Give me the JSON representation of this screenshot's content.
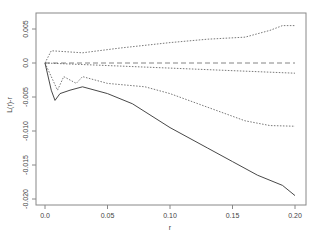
{
  "chart_data": {
    "type": "line",
    "title": "",
    "xlabel": "r",
    "ylabel": "L(r)-r",
    "xlim": [
      0.0,
      0.2
    ],
    "ylim": [
      -0.02,
      0.006
    ],
    "xticks": [
      "0.0",
      "0.05",
      "0.10",
      "0.15",
      "0.20"
    ],
    "yticks": [
      "0.005",
      "0.0",
      "-0.005",
      "-0.010",
      "-0.015",
      "-0.020"
    ],
    "grid": false,
    "legend": null,
    "series": [
      {
        "name": "observed",
        "style": "solid",
        "x": [
          0,
          0.005,
          0.008,
          0.012,
          0.02,
          0.03,
          0.05,
          0.07,
          0.1,
          0.13,
          0.15,
          0.17,
          0.19,
          0.2
        ],
        "values": [
          0,
          -0.004,
          -0.0055,
          -0.0045,
          -0.004,
          -0.0035,
          -0.0045,
          -0.006,
          -0.0095,
          -0.0125,
          -0.0145,
          -0.0165,
          -0.018,
          -0.0195
        ]
      },
      {
        "name": "upper envelope",
        "style": "dotted",
        "x": [
          0,
          0.005,
          0.03,
          0.06,
          0.1,
          0.13,
          0.16,
          0.18,
          0.19,
          0.2
        ],
        "values": [
          0,
          0.0018,
          0.0015,
          0.0022,
          0.003,
          0.0035,
          0.0038,
          0.0048,
          0.0055,
          0.0055
        ]
      },
      {
        "name": "lower envelope",
        "style": "dotted",
        "x": [
          0,
          0.01,
          0.015,
          0.025,
          0.03,
          0.05,
          0.08,
          0.1,
          0.13,
          0.16,
          0.18,
          0.2
        ],
        "values": [
          0,
          -0.004,
          -0.002,
          -0.003,
          -0.002,
          -0.003,
          -0.0035,
          -0.0045,
          -0.0065,
          -0.0085,
          -0.0092,
          -0.0093
        ]
      },
      {
        "name": "mean",
        "style": "dotted",
        "x": [
          0,
          0.2
        ],
        "values": [
          0,
          -0.0015
        ]
      },
      {
        "name": "theoretical",
        "style": "dashed",
        "x": [
          0,
          0.2
        ],
        "values": [
          0,
          0
        ]
      }
    ]
  }
}
